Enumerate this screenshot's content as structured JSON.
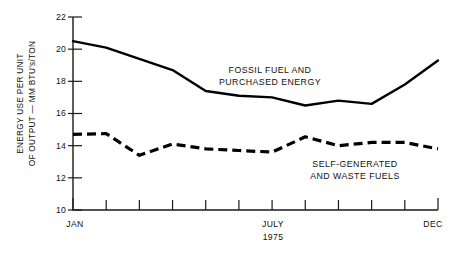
{
  "chart_data": {
    "type": "line",
    "title": "",
    "subtitle": "",
    "xlabel_left": "JAN",
    "xlabel_center": "JULY",
    "xlabel_center_sub": "1975",
    "xlabel_right": "DEC",
    "ylabel_line1": "ENERGY USE PER UNIT",
    "ylabel_line2": "OF OUTPUT — MM BTU's/TON",
    "categories": [
      "JAN",
      "FEB",
      "MAR",
      "APR",
      "MAY",
      "JUN",
      "JULY",
      "AUG",
      "SEP",
      "OCT",
      "NOV",
      "DEC"
    ],
    "ylim": [
      10,
      22
    ],
    "yticks": [
      10,
      12,
      14,
      16,
      18,
      20,
      22
    ],
    "ytick_labels": [
      "10",
      "12",
      "14",
      "16",
      "18",
      "20",
      "22"
    ],
    "grid": false,
    "legend_position": "inline-annotation",
    "series": [
      {
        "name": "FOSSIL FUEL AND PURCHASED ENERGY",
        "annotation_line1": "FOSSIL FUEL AND",
        "annotation_line2": "PURCHASED ENERGY",
        "style": "solid",
        "color": "#000000",
        "values": [
          20.5,
          20.1,
          19.4,
          18.7,
          17.4,
          17.1,
          17.0,
          16.5,
          16.8,
          16.6,
          17.8,
          19.3
        ]
      },
      {
        "name": "SELF-GENERATED AND WASTE FUELS",
        "annotation_line1": "SELF-GENERATED",
        "annotation_line2": "AND WASTE FUELS",
        "style": "dashed",
        "color": "#000000",
        "values": [
          14.7,
          14.75,
          13.4,
          14.1,
          13.8,
          13.7,
          13.6,
          14.55,
          14.0,
          14.2,
          14.2,
          13.8
        ]
      }
    ]
  },
  "axes": {
    "axis_color": "#1a1a1a",
    "background": "#ffffff"
  }
}
